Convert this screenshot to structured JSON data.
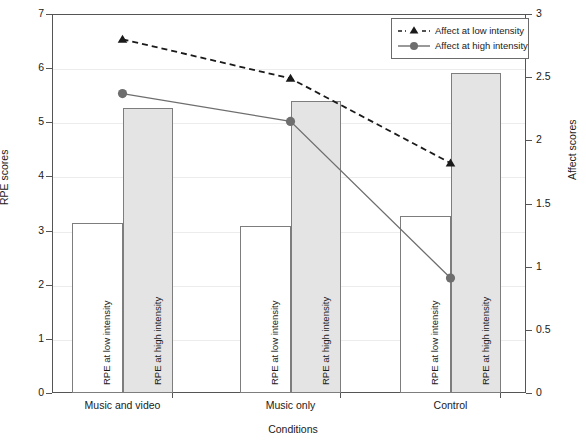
{
  "chart_data": {
    "type": "bar",
    "title": "",
    "subtitle": "",
    "xlabel": "Conditions",
    "ylabel": "RPE scores",
    "ylabel_right": "Affect scores",
    "categories": [
      "Music and video",
      "Music only",
      "Control"
    ],
    "ylim": [
      0,
      7
    ],
    "yticks": [
      "0",
      "1",
      "2",
      "3",
      "4",
      "5",
      "6",
      "7"
    ],
    "ylim_right": [
      0,
      3
    ],
    "yticks_right": [
      "0",
      "0.5",
      "1",
      "1.5",
      "2",
      "2.5",
      "3"
    ],
    "grid": true,
    "legend_position": "top-right",
    "bar_series": [
      {
        "name": "RPE at low intensity",
        "axis": "left",
        "fill": "#ffffff",
        "stroke": "#7d7d7d",
        "values": [
          3.14,
          3.08,
          3.27
        ]
      },
      {
        "name": "RPE at high intensity",
        "axis": "left",
        "fill": "#e4e4e4",
        "stroke": "#7d7d7d",
        "values": [
          5.27,
          5.39,
          5.91
        ]
      }
    ],
    "line_series": [
      {
        "name": "Affect at low intensity",
        "axis": "right",
        "marker": "triangle",
        "dash": "dashed",
        "color": "#1a1a1a",
        "values": [
          2.8,
          2.49,
          1.82
        ]
      },
      {
        "name": "Affect at high intensity",
        "axis": "right",
        "marker": "circle",
        "dash": "solid",
        "color": "#6e6e6e",
        "values": [
          2.37,
          2.15,
          0.91
        ]
      }
    ]
  },
  "legend": {
    "items": [
      {
        "label": "Affect at low intensity",
        "marker": "triangle-icon",
        "dash": "dashed"
      },
      {
        "label": "Affect at high intensity",
        "marker": "circle-icon",
        "dash": "solid"
      }
    ]
  },
  "bar_labels": [
    "RPE at low intensity",
    "RPE at high intensity",
    "RPE at low intensity",
    "RPE at high intensity",
    "RPE at low intensity",
    "RPE at high intensity"
  ],
  "colors": {
    "bar_low_fill": "#ffffff",
    "bar_high_fill": "#e4e4e4",
    "bar_stroke": "#7d7d7d",
    "line_low": "#1a1a1a",
    "line_high": "#6e6e6e",
    "axis": "#555555",
    "grid": "#ececec"
  }
}
